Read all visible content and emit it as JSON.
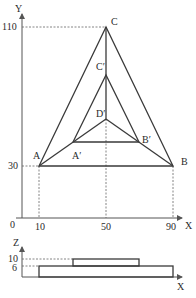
{
  "top_view": {
    "axes": {
      "x_label": "X",
      "y_label": "Y",
      "origin_label": "0",
      "x_ticks": [
        "10",
        "50",
        "90"
      ],
      "y_ticks": [
        "30",
        "110"
      ]
    },
    "points": {
      "A": {
        "label": "A",
        "x": 10,
        "y": 30
      },
      "B": {
        "label": "B",
        "x": 90,
        "y": 30
      },
      "C": {
        "label": "C",
        "x": 50,
        "y": 110
      },
      "A_prime": {
        "label": "A′"
      },
      "B_prime": {
        "label": "B′"
      },
      "C_prime": {
        "label": "C′"
      },
      "D_prime": {
        "label": "D′"
      }
    }
  },
  "side_view": {
    "axes": {
      "x_label": "X",
      "z_label": "Z",
      "z_ticks": [
        "10",
        "6"
      ]
    }
  }
}
